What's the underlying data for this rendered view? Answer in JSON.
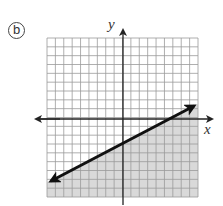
{
  "problem_label": "b",
  "axes": {
    "x_label": "x",
    "y_label": "y"
  },
  "colors": {
    "grid_line": "#9a9a9a",
    "shade": "#d9d9d9",
    "line": "#111111",
    "axis": "#222222"
  },
  "chart_data": {
    "type": "line",
    "title": "",
    "xlabel": "x",
    "ylabel": "y",
    "xlim": [
      -9,
      9
    ],
    "ylim": [
      -9,
      9
    ],
    "grid": true,
    "series": [
      {
        "name": "boundary line y = 1/2 x - 3",
        "style": "solid",
        "arrows": "both",
        "x": [
          -8.8,
          8.7
        ],
        "y": [
          -7.4,
          1.35
        ]
      }
    ],
    "shaded_region": "below line (y ≤ ½x − 3)",
    "inequality": "y ≤ 1/2 x − 3"
  }
}
